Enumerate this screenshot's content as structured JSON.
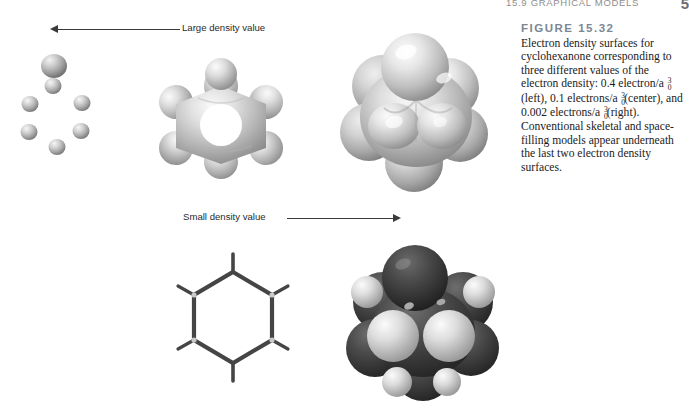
{
  "running_head": {
    "section": "15.9  GRAPHICAL MODELS",
    "page_number": "5"
  },
  "figure": {
    "label": "FIGURE 15.32",
    "caption_lines": [
      "Electron density surfaces for cyclo-",
      "hexanone corresponding to three",
      "different values of the electron density:",
      "0.4 electron/a₀³ (left), 0.1 electrons/a₀³",
      "(center), and 0.002 electrons/a₀³ (right).",
      "Conventional skeletal and space-filling",
      "models appear underneath the last",
      "two electron density surfaces."
    ],
    "caption_full": "Electron density surfaces for cyclohexanone corresponding to three different values of the electron density: 0.4 electron/a₀³ (left), 0.1 electrons/a₀³ (center), and 0.002 electrons/a₀³ (right). Conventional skeletal and space-filling models appear underneath the last two electron density surfaces.",
    "density_values": [
      {
        "value": "0.4",
        "unit": "electron/a₀³",
        "position": "left"
      },
      {
        "value": "0.1",
        "unit": "electrons/a₀³",
        "position": "center"
      },
      {
        "value": "0.002",
        "unit": "electrons/a₀³",
        "position": "right"
      }
    ]
  },
  "annotations": {
    "large_density": {
      "label": "Large density value",
      "direction": "left"
    },
    "small_density": {
      "label": "Small density value",
      "direction": "right"
    }
  },
  "panels": [
    {
      "name": "density-surface-high",
      "caption_ref": "0.4 electron/a₀³",
      "type": "isolated-spheres"
    },
    {
      "name": "density-surface-medium",
      "caption_ref": "0.1 electrons/a₀³",
      "type": "star-shaped-surface"
    },
    {
      "name": "density-surface-low",
      "caption_ref": "0.002 electrons/a₀³",
      "type": "blob-surface"
    },
    {
      "name": "skeletal-model",
      "caption_ref": "skeletal",
      "type": "wireframe-hexagon"
    },
    {
      "name": "space-filling-model",
      "caption_ref": "space-filling",
      "type": "cpk-spheres"
    }
  ],
  "colors": {
    "figure_label": "#7b8794",
    "running_head": "#8e8e8e",
    "body_text": "#1b1b1b",
    "arrow": "#3a3a3a",
    "surface_light": "#e8e8e8",
    "surface_mid": "#b4b4b4",
    "surface_dark": "#7a7a7a",
    "carbon": "#4a4a4a",
    "hydrogen": "#d8d8d8",
    "oxygen": "#383838"
  }
}
